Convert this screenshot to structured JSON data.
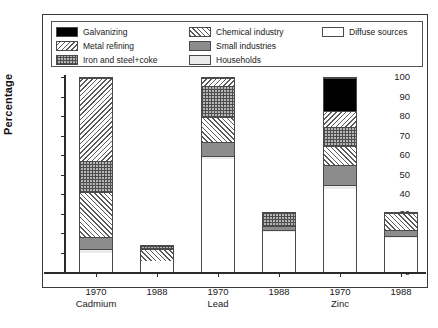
{
  "chart_data": {
    "type": "bar",
    "subtype": "stacked-vertical-percentage",
    "title": "",
    "xlabel": "",
    "ylabel": "Percentage",
    "ylim": [
      0,
      100
    ],
    "yticks": [
      0,
      10,
      20,
      30,
      40,
      50,
      60,
      70,
      80,
      90,
      100
    ],
    "grid": false,
    "legend_position": "top-inside",
    "categories": [
      "1970",
      "1988",
      "1970",
      "1988",
      "1970",
      "1988"
    ],
    "group_labels": [
      "Cadmium",
      "Lead",
      "Zinc"
    ],
    "groups": [
      {
        "element": "Cadmium",
        "year": "1970"
      },
      {
        "element": "Cadmium",
        "year": "1988"
      },
      {
        "element": "Lead",
        "year": "1970"
      },
      {
        "element": "Lead",
        "year": "1988"
      },
      {
        "element": "Zinc",
        "year": "1970"
      },
      {
        "element": "Zinc",
        "year": "1988"
      }
    ],
    "series": [
      {
        "name": "Diffuse sources",
        "key": "diffuse",
        "pattern": "empty-white",
        "values": [
          10,
          6,
          58,
          21,
          43,
          18
        ]
      },
      {
        "name": "Households",
        "key": "households",
        "pattern": "solid-light-gray",
        "values": [
          2,
          0,
          2,
          1,
          2,
          1
        ]
      },
      {
        "name": "Small industries",
        "key": "small_industries",
        "pattern": "solid-gray",
        "values": [
          6,
          0,
          7,
          2,
          10,
          3
        ]
      },
      {
        "name": "Chemical industry",
        "key": "chemical",
        "pattern": "diagonal-hatch-fwd",
        "values": [
          23,
          6,
          13,
          0,
          10,
          9
        ]
      },
      {
        "name": "Iron and steel+coke",
        "key": "iron_steel_coke",
        "pattern": "cross-hatch",
        "values": [
          16,
          2,
          16,
          7,
          10,
          0
        ]
      },
      {
        "name": "Metal refining",
        "key": "metal_refining",
        "pattern": "diagonal-hatch-back",
        "values": [
          43,
          0,
          4,
          0,
          8,
          0
        ]
      },
      {
        "name": "Galvanizing",
        "key": "galvanizing",
        "pattern": "solid-black",
        "values": [
          0,
          0,
          0,
          0,
          17,
          0
        ]
      }
    ],
    "bar_totals": [
      100,
      14,
      100,
      31,
      100,
      31
    ]
  },
  "legend": {
    "column_1": [
      {
        "label": "Galvanizing",
        "swatch": "solid-black"
      },
      {
        "label": "Metal refining",
        "swatch": "diagonal-hatch-back"
      },
      {
        "label": "Iron and steel+coke",
        "swatch": "cross-hatch"
      }
    ],
    "column_2": [
      {
        "label": "Chemical industry",
        "swatch": "diagonal-hatch-fwd"
      },
      {
        "label": "Small industries",
        "swatch": "solid-gray"
      },
      {
        "label": "Households",
        "swatch": "solid-light-gray"
      }
    ],
    "column_3": [
      {
        "label": "Diffuse sources",
        "swatch": "empty-white"
      }
    ]
  },
  "axes": {
    "y_title": "Percentage",
    "y_tick_labels": [
      "0",
      "10",
      "20",
      "30",
      "40",
      "50",
      "60",
      "70",
      "80",
      "90",
      "100"
    ],
    "x_year_labels": [
      "1970",
      "1988",
      "1970",
      "1988",
      "1970",
      "1988"
    ],
    "x_group_labels": [
      "Cadmium",
      "Lead",
      "Zinc"
    ]
  },
  "colors": {
    "axis": "#2b2b2b",
    "frame": "#3a3a3a",
    "galvanizing": "#000000",
    "small_industries": "#8c8c8c",
    "households": "#ebebeb",
    "diffuse_sources": "#ffffff",
    "hatch_line": "#5a5a5a",
    "background": "#ffffff"
  }
}
